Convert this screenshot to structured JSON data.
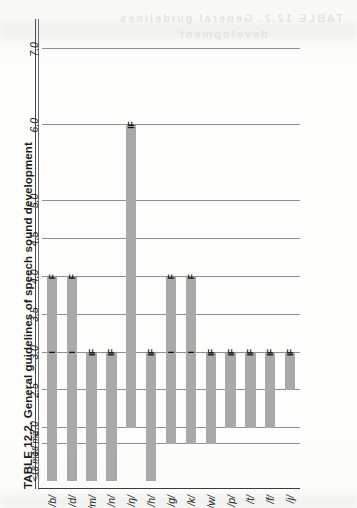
{
  "page": {
    "background_color": "#fdfdfc",
    "bleed_through_text_top": "TABLE 12.2. General guidelines",
    "bleed_through_text_bottom": "development"
  },
  "table": {
    "number_label": "TABLE 12.2.",
    "title": "TABLE 12.2.  General guidelines of speech sound development"
  },
  "chart_data": {
    "type": "bar",
    "orientation": "horizontal-on-page-rotated-90ccw",
    "title": "TABLE 12.2.  General guidelines of speech sound development",
    "xlabel": "",
    "ylabel": "",
    "grid": true,
    "legend": null,
    "bar_color": "#a9a9a9",
    "gridline_color": "#8f8f8f",
    "axis_color": "#3a3a3a",
    "xlim": [
      1.2,
      7.4
    ],
    "axis_ticks": [
      {
        "value": 1.5,
        "label": "<18 mo"
      },
      {
        "value": 1.8,
        "label": "18 mo"
      },
      {
        "value": 2.0,
        "label": "2.0"
      },
      {
        "value": 2.5,
        "label": "2.5"
      },
      {
        "value": 3.0,
        "label": "3.0"
      },
      {
        "value": 3.5,
        "label": "3.5"
      },
      {
        "value": 4.0,
        "label": "4.0"
      },
      {
        "value": 4.5,
        "label": "4.5"
      },
      {
        "value": 5.0,
        "label": "5.0"
      },
      {
        "value": 6.0,
        "label": "6.0"
      },
      {
        "value": 7.0,
        "label": "7.0"
      }
    ],
    "gridline_values": [
      1.8,
      2.0,
      2.5,
      3.0,
      3.5,
      4.0,
      4.5,
      5.0,
      6.0,
      7.0
    ],
    "categories": [
      "/b/",
      "/d/",
      "/m/",
      "/n/",
      "/ŋ/",
      "/h/",
      "/g/",
      "/k/",
      "/w/",
      "/p/",
      "/t/",
      "/f/",
      "/j/"
    ],
    "bars": [
      {
        "category": "/b/",
        "start": 1.3,
        "end": 4.0,
        "markers": [
          {
            "label": "I",
            "value": 3.0
          },
          {
            "label": "F",
            "value": 4.0
          }
        ]
      },
      {
        "category": "/d/",
        "start": 1.3,
        "end": 4.0,
        "markers": [
          {
            "label": "I",
            "value": 3.0
          },
          {
            "label": "F",
            "value": 4.0
          }
        ]
      },
      {
        "category": "/m/",
        "start": 1.3,
        "end": 3.0,
        "markers": [
          {
            "label": "IF",
            "value": 3.0
          }
        ]
      },
      {
        "category": "/n/",
        "start": 1.3,
        "end": 3.0,
        "markers": [
          {
            "label": "IF",
            "value": 3.0
          }
        ]
      },
      {
        "category": "/ŋ/",
        "start": 2.0,
        "end": 6.0,
        "markers": [
          {
            "label": "IF",
            "value": 6.0
          }
        ]
      },
      {
        "category": "/h/",
        "start": 1.3,
        "end": 3.0,
        "markers": [
          {
            "label": "IF",
            "value": 3.0
          }
        ]
      },
      {
        "category": "/g/",
        "start": 1.8,
        "end": 4.0,
        "markers": [
          {
            "label": "I",
            "value": 3.0
          },
          {
            "label": "F",
            "value": 4.0
          }
        ]
      },
      {
        "category": "/k/",
        "start": 1.8,
        "end": 4.0,
        "markers": [
          {
            "label": "I",
            "value": 3.0
          },
          {
            "label": "F",
            "value": 4.0
          }
        ]
      },
      {
        "category": "/w/",
        "start": 1.8,
        "end": 3.0,
        "markers": [
          {
            "label": "IF",
            "value": 3.0
          }
        ]
      },
      {
        "category": "/p/",
        "start": 2.0,
        "end": 3.0,
        "markers": [
          {
            "label": "IF",
            "value": 3.0
          }
        ]
      },
      {
        "category": "/t/",
        "start": 2.0,
        "end": 3.0,
        "markers": [
          {
            "label": "IF",
            "value": 3.0
          }
        ]
      },
      {
        "category": "/f/",
        "start": 2.0,
        "end": 3.0,
        "markers": [
          {
            "label": "IF",
            "value": 3.0
          }
        ]
      },
      {
        "category": "/j/",
        "start": 2.5,
        "end": 3.0,
        "markers": [
          {
            "label": "IF",
            "value": 3.0
          }
        ]
      }
    ],
    "marker_legend": {
      "I": "Initial position",
      "F": "Final position",
      "IF": "Initial and Final position"
    }
  }
}
